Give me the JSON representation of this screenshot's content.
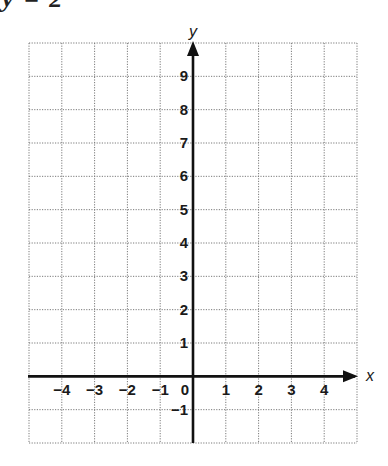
{
  "header_fragment": "y = 2",
  "chart_data": {
    "type": "coordinate-grid",
    "title": "",
    "xlabel": "x",
    "ylabel": "y",
    "xlim": [
      -5,
      5
    ],
    "ylim": [
      -2,
      10
    ],
    "grid": "dotted",
    "x_ticks": [
      -4,
      -3,
      -2,
      -1,
      0,
      1,
      2,
      3,
      4
    ],
    "y_ticks": [
      9,
      8,
      7,
      6,
      5,
      4,
      3,
      2,
      1,
      -1
    ],
    "x_tick_labels": [
      "−4",
      "−3",
      "−2",
      "−1",
      "0",
      "1",
      "2",
      "3",
      "4"
    ],
    "y_tick_labels": [
      "9",
      "8",
      "7",
      "6",
      "5",
      "4",
      "3",
      "2",
      "1",
      "−1"
    ],
    "series": []
  },
  "colors": {
    "grid": "#7a7a7a",
    "axis": "#111111",
    "text": "#1a1a1a"
  }
}
